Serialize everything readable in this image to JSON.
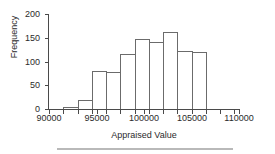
{
  "chart_data": {
    "type": "bar",
    "title": "",
    "subtitle": "",
    "xlabel": "Appraised Value",
    "ylabel": "Frequency",
    "xlim": [
      90000,
      110000
    ],
    "ylim": [
      0,
      200
    ],
    "grid": false,
    "legend": null,
    "xticks": [
      "90000",
      "95000",
      "100000",
      "105000",
      "110000"
    ],
    "xtick_values": [
      90000,
      95000,
      100000,
      105000,
      110000
    ],
    "yticks": [
      "0",
      "50",
      "100",
      "150",
      "200"
    ],
    "ytick_values": [
      0,
      50,
      100,
      150,
      200
    ],
    "bin_width": 1500,
    "bins": [
      {
        "start": 91500,
        "end": 93000,
        "frequency": 5
      },
      {
        "start": 93000,
        "end": 94500,
        "frequency": 18
      },
      {
        "start": 94500,
        "end": 96000,
        "frequency": 79
      },
      {
        "start": 96000,
        "end": 97500,
        "frequency": 77
      },
      {
        "start": 97500,
        "end": 99000,
        "frequency": 115
      },
      {
        "start": 99000,
        "end": 100500,
        "frequency": 148
      },
      {
        "start": 100500,
        "end": 102000,
        "frequency": 142
      },
      {
        "start": 102000,
        "end": 103500,
        "frequency": 163
      },
      {
        "start": 103500,
        "end": 105000,
        "frequency": 123
      },
      {
        "start": 105000,
        "end": 106500,
        "frequency": 121
      }
    ],
    "categories": [
      "91500",
      "93000",
      "94500",
      "96000",
      "97500",
      "99000",
      "100500",
      "102000",
      "103500",
      "105000"
    ],
    "values": [
      5,
      18,
      79,
      77,
      115,
      148,
      142,
      163,
      123,
      121
    ],
    "colors": {
      "bar_edge": "#6b6b6b",
      "bar_fill": "#ffffff",
      "axis": "#4a4a4a",
      "text": "#2b2b2b",
      "footer_rule": "#b9b9b9"
    }
  }
}
